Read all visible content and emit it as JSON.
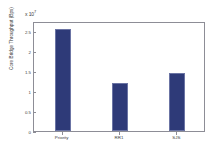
{
  "chart_data": {
    "type": "bar",
    "title": "",
    "subtitle": "",
    "xlabel": "",
    "ylabel": "Core Bridge Throughput (Bps)",
    "categories": [
      "Priority",
      "RR1",
      "SJS"
    ],
    "values": [
      2.55,
      1.2,
      1.45
    ],
    "value_scale": 10000000,
    "exponent_label_prefix": "x 10",
    "exponent_label_power": "7",
    "ylim": [
      0,
      2.75
    ],
    "yticks": [
      0,
      0.5,
      1,
      1.5,
      2,
      2.5
    ],
    "ytick_labels": [
      "0",
      "0.5",
      "1",
      "1.5",
      "2",
      "2.5"
    ],
    "grid": false,
    "legend": null,
    "bar_color": "#2e3a78",
    "bar_edge_color": "#6b74a4",
    "axis_color": "#8d8d96",
    "background_color": "#ffffff",
    "text_color": "#3a3a3a"
  }
}
